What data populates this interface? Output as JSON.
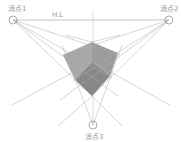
{
  "diagram": {
    "type": "three-point-perspective",
    "horizon_label": "H.L",
    "vanishing_points": [
      {
        "label": "消点1",
        "x": 13,
        "y": 20
      },
      {
        "label": "消点2",
        "x": 169,
        "y": 20
      },
      {
        "label": "消点3",
        "x": 93,
        "y": 125
      }
    ],
    "colors": {
      "lines": "#a0a0a0",
      "cube_top": "#a8a8a8",
      "cube_left": "#9a9a9a",
      "cube_right": "#8c8c8c",
      "label": "#999999"
    }
  }
}
